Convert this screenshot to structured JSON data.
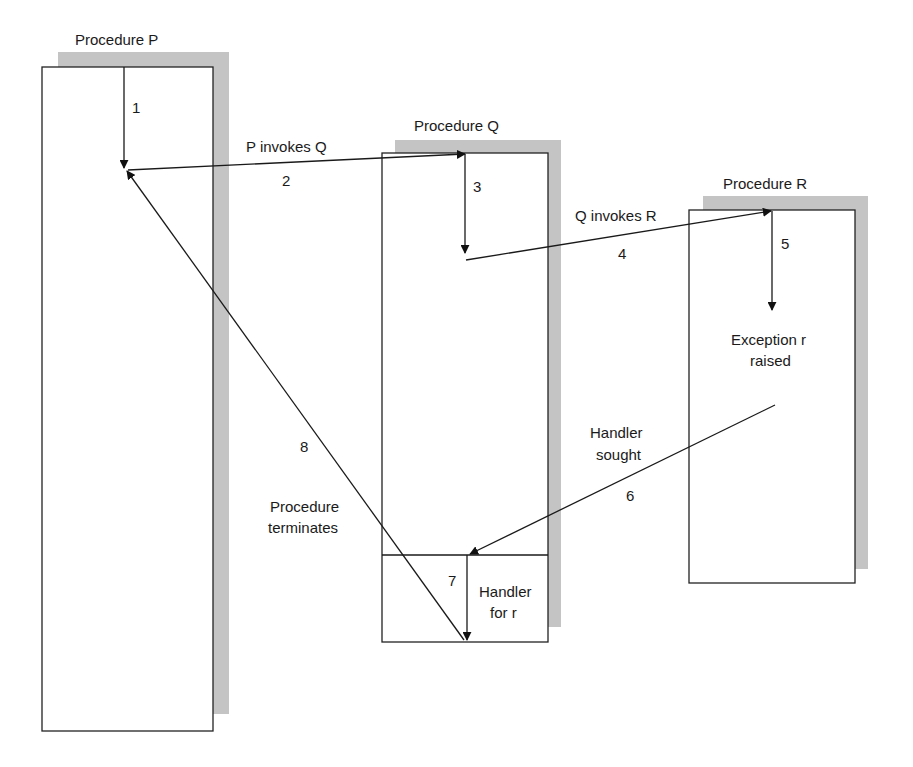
{
  "diagram": {
    "procedures": [
      {
        "id": "P",
        "label": "Procedure P"
      },
      {
        "id": "Q",
        "label": "Procedure Q",
        "handler": {
          "label_line1": "Handler",
          "label_line2": "for r"
        }
      },
      {
        "id": "R",
        "label": "Procedure R",
        "note": {
          "line1": "Exception r",
          "line2": "raised"
        }
      }
    ],
    "steps": [
      {
        "n": "1"
      },
      {
        "n": "2",
        "label": "P invokes Q"
      },
      {
        "n": "3"
      },
      {
        "n": "4",
        "label": "Q invokes R"
      },
      {
        "n": "5"
      },
      {
        "n": "6",
        "label_line1": "Handler",
        "label_line2": "sought"
      },
      {
        "n": "7"
      },
      {
        "n": "8",
        "label_line1": "Procedure",
        "label_line2": "terminates"
      }
    ],
    "colors": {
      "line": "#1a1a1a",
      "box_border": "#222222",
      "shadow": "#c4c4c4",
      "background": "#ffffff"
    }
  }
}
